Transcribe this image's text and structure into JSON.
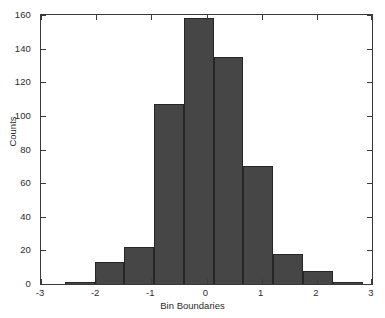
{
  "chart_data": {
    "type": "bar",
    "subtype": "histogram",
    "title": "",
    "xlabel": "Bin Boundaries",
    "ylabel": "Counts",
    "xlim": [
      -3,
      3
    ],
    "ylim": [
      0,
      160
    ],
    "xticks": [
      -3,
      -2,
      -1,
      0,
      1,
      2,
      3
    ],
    "xticklabels": [
      "-3",
      "-2",
      "-1",
      "0",
      "1",
      "2",
      "3"
    ],
    "yticks": [
      0,
      20,
      40,
      60,
      80,
      100,
      120,
      140,
      160
    ],
    "yticklabels": [
      "0",
      "20",
      "40",
      "60",
      "80",
      "100",
      "120",
      "140",
      "160"
    ],
    "grid": false,
    "legend": null,
    "bar_color": "#464646",
    "bar_edge_color": "#262626",
    "axes_color": "#3a3a3a",
    "background": "#ffffff",
    "bin_width": 0.54,
    "bin_centers": [
      -2.3,
      -1.76,
      -1.22,
      -0.68,
      -0.14,
      0.4,
      0.94,
      1.48,
      2.02,
      2.56
    ],
    "bin_edges": [
      -2.57,
      -2.03,
      -1.49,
      -0.95,
      -0.41,
      0.13,
      0.67,
      1.21,
      1.75,
      2.29,
      2.83
    ],
    "categories": [
      "-2.57 to -2.03",
      "-2.03 to -1.49",
      "-1.49 to -0.95",
      "-0.95 to -0.41",
      "-0.41 to 0.13",
      "0.13 to 0.67",
      "0.67 to 1.21",
      "1.21 to 1.75",
      "1.75 to 2.29",
      "2.29 to 2.83"
    ],
    "values": [
      1,
      13,
      22,
      107,
      158,
      135,
      70,
      18,
      8,
      1
    ]
  }
}
